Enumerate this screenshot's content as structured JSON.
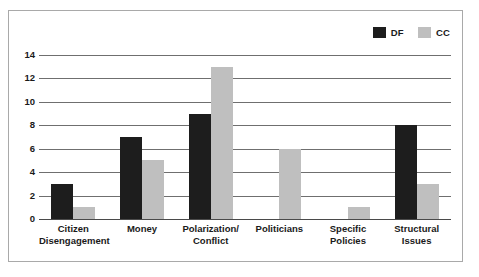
{
  "chart_data": {
    "type": "bar",
    "title": "",
    "subtitle": "",
    "xlabel": "",
    "ylabel": "",
    "categories": [
      "Citizen\nDisengagement",
      "Money",
      "Polarization/\nConflict",
      "Politicians",
      "Specific\nPolicies",
      "Structural\nIssues"
    ],
    "series": [
      {
        "name": "DF",
        "color": "#1d1d1d",
        "values": [
          3,
          7,
          9,
          0,
          0,
          8
        ]
      },
      {
        "name": "CC",
        "color": "#bfbfbf",
        "values": [
          1,
          5,
          13,
          6,
          1,
          3
        ]
      }
    ],
    "ylim": [
      0,
      14
    ],
    "yticks": [
      0,
      2,
      4,
      6,
      8,
      10,
      12,
      14
    ],
    "ytick_labels": [
      "0",
      "2",
      "4",
      "6",
      "8",
      "10",
      "12",
      "14"
    ],
    "grid": true,
    "legend_position": "top-right"
  },
  "legend": {
    "entries": [
      {
        "label": "DF",
        "color": "#1d1d1d"
      },
      {
        "label": "CC",
        "color": "#bfbfbf"
      }
    ]
  },
  "colors": {
    "series_df": "#1d1d1d",
    "series_cc": "#bfbfbf",
    "gridline": "#6f6f6f",
    "axis": "#4a4a4a",
    "border": "#a9a9a9",
    "background": "#ffffff",
    "text": "#1a1a1a"
  }
}
